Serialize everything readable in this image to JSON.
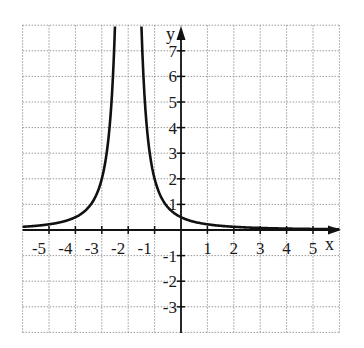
{
  "chart_data": {
    "type": "line",
    "title": "",
    "function": "y = 2/(x+2)^2",
    "xlabel": "x",
    "ylabel": "y",
    "xlim": [
      -6,
      6
    ],
    "ylim": [
      -4,
      8
    ],
    "grid": true,
    "vertical_asymptote": -2,
    "x_ticks": [
      -5,
      -4,
      -3,
      -2,
      -1,
      1,
      2,
      3,
      4,
      5
    ],
    "x_tick_labels": [
      "-5",
      "-4",
      "-3",
      "-2",
      "-1",
      "1",
      "2",
      "3",
      "4",
      "5"
    ],
    "y_ticks": [
      7,
      6,
      5,
      4,
      3,
      2,
      1,
      -1,
      -2,
      -3
    ],
    "y_tick_labels": [
      "7",
      "6",
      "5",
      "4",
      "3",
      "2",
      "1",
      "-1",
      "-2",
      "-3"
    ],
    "series": [
      {
        "name": "curve",
        "x": [
          -6,
          -5,
          -4,
          -3.5,
          -3,
          -2.75,
          -2.5,
          -1.5,
          -1.25,
          -1,
          -0.5,
          0,
          1,
          2,
          3,
          4,
          5,
          6
        ],
        "y": [
          0.125,
          0.22,
          0.5,
          0.89,
          2,
          3.56,
          8,
          8,
          3.56,
          2,
          0.89,
          0.5,
          0.22,
          0.125,
          0.08,
          0.056,
          0.04,
          0.031
        ]
      }
    ]
  },
  "labels": {
    "x_axis": "x",
    "y_axis": "y"
  },
  "style": {
    "curve_color": "#111111",
    "grid_color": "#9a9a9a",
    "axis_color": "#111111"
  }
}
